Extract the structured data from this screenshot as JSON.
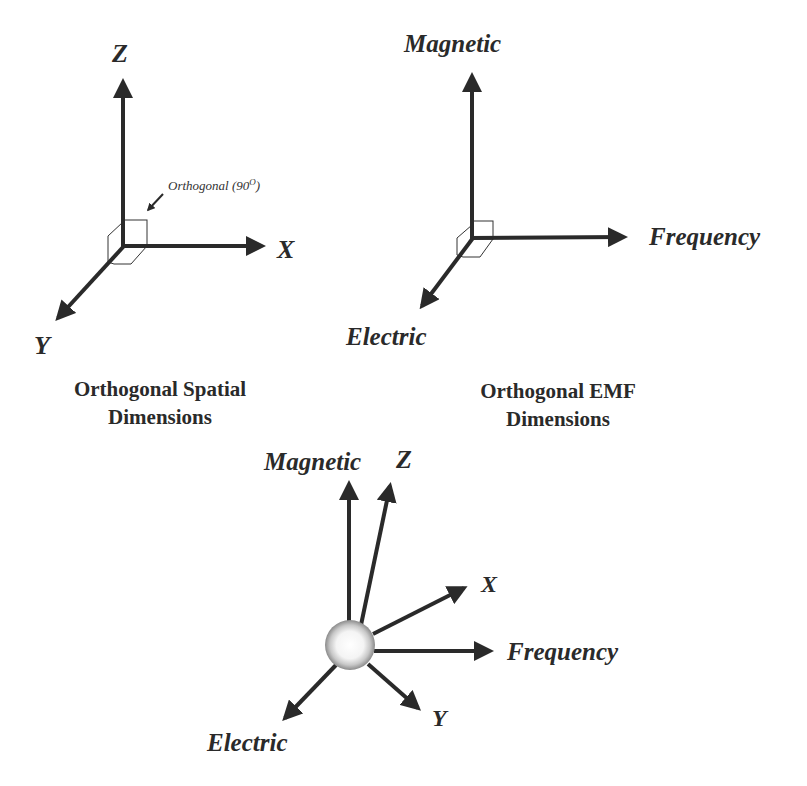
{
  "panels": {
    "spatial": {
      "axes": {
        "z": "Z",
        "x": "X",
        "y": "Y"
      },
      "annotation": "Orthogonal (90",
      "annotation_sup": "O",
      "annotation_close": ")",
      "caption_line1": "Orthogonal Spatial",
      "caption_line2": "Dimensions"
    },
    "emf": {
      "axes": {
        "magnetic": "Magnetic",
        "frequency": "Frequency",
        "electric": "Electric"
      },
      "caption_line1": "Orthogonal EMF",
      "caption_line2": "Dimensions"
    },
    "combined": {
      "axes": {
        "magnetic": "Magnetic",
        "z": "Z",
        "x": "X",
        "frequency": "Frequency",
        "y": "Y",
        "electric": "Electric"
      }
    }
  },
  "colors": {
    "ink": "#2a2a2a",
    "background": "#ffffff"
  }
}
